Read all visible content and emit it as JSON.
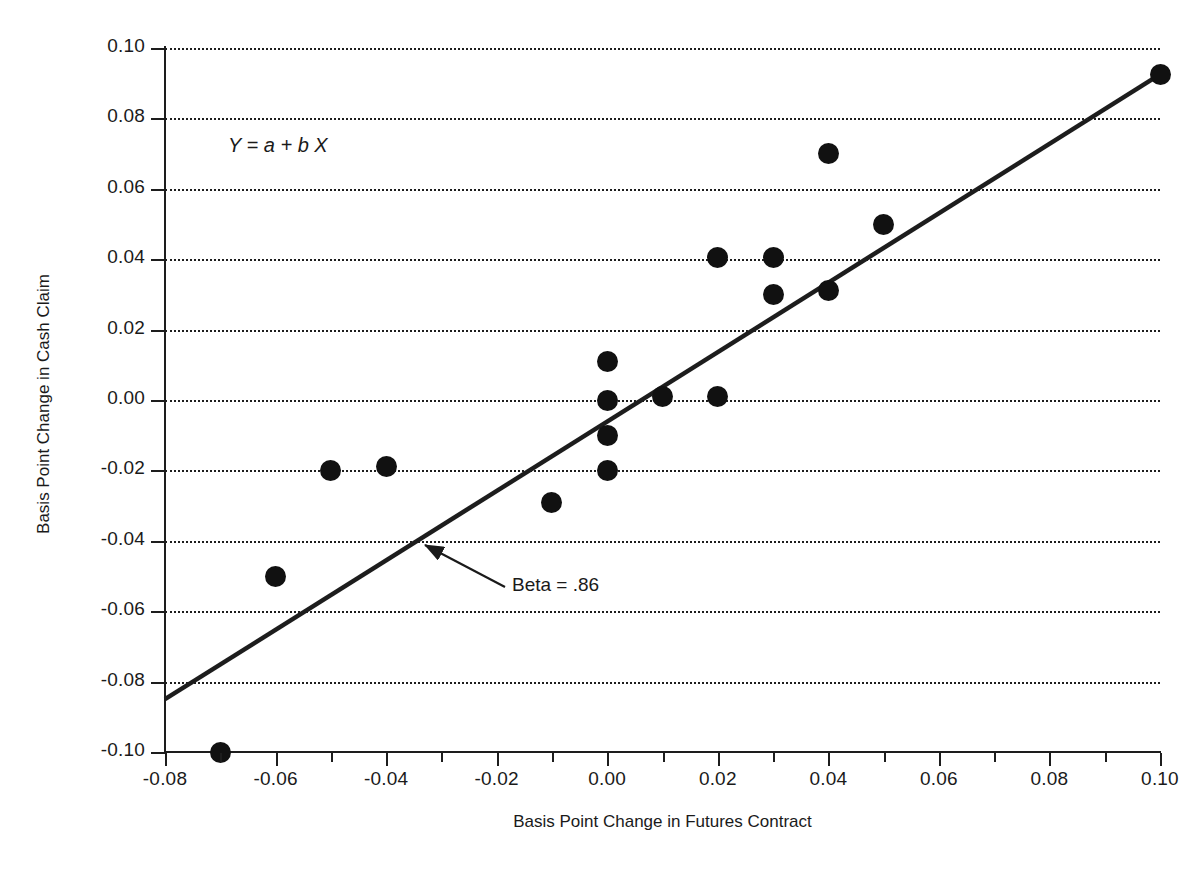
{
  "chart_data": {
    "type": "scatter",
    "title": "",
    "xlabel": "Basis Point Change in Futures Contract",
    "ylabel": "Basis Point Change in Cash Claim",
    "xlim": [
      -0.08,
      0.1
    ],
    "ylim": [
      -0.1,
      0.1
    ],
    "grid": "horizontal-dotted",
    "legend": "none",
    "xticks": [
      -0.08,
      -0.06,
      -0.04,
      -0.02,
      0.0,
      0.02,
      0.04,
      0.06,
      0.08,
      0.1
    ],
    "xtick_labels": [
      "-0.08",
      "-0.06",
      "-0.04",
      "-0.02",
      "0.00",
      "0.02",
      "0.04",
      "0.06",
      "0.08",
      "0.10"
    ],
    "x_minor_ticks": [
      -0.07,
      -0.05,
      -0.03,
      -0.01,
      0.01,
      0.03,
      0.05,
      0.07,
      0.09
    ],
    "yticks": [
      0.1,
      0.08,
      0.06,
      0.04,
      0.02,
      0.0,
      -0.02,
      -0.04,
      -0.06,
      -0.08,
      -0.1
    ],
    "ytick_labels": [
      "0.10",
      "0.08",
      "0.06",
      "0.04",
      "0.02",
      "0.00",
      "-0.02",
      "-0.04",
      "-0.06",
      "-0.08",
      "-0.10"
    ],
    "points": [
      {
        "x": -0.07,
        "y": -0.1
      },
      {
        "x": -0.06,
        "y": -0.05
      },
      {
        "x": -0.05,
        "y": -0.02
      },
      {
        "x": -0.04,
        "y": -0.019
      },
      {
        "x": -0.01,
        "y": -0.029
      },
      {
        "x": 0.0,
        "y": 0.011
      },
      {
        "x": 0.0,
        "y": 0.0
      },
      {
        "x": 0.0,
        "y": -0.01
      },
      {
        "x": 0.0,
        "y": -0.02
      },
      {
        "x": 0.01,
        "y": 0.001
      },
      {
        "x": 0.02,
        "y": 0.0405
      },
      {
        "x": 0.02,
        "y": 0.001
      },
      {
        "x": 0.03,
        "y": 0.0405
      },
      {
        "x": 0.03,
        "y": 0.03
      },
      {
        "x": 0.04,
        "y": 0.07
      },
      {
        "x": 0.04,
        "y": 0.031
      },
      {
        "x": 0.05,
        "y": 0.05
      },
      {
        "x": 0.1,
        "y": 0.0925
      }
    ],
    "fit_line": {
      "slope": 0.86,
      "x_start": -0.08,
      "y_start": -0.085,
      "x_end": 0.1,
      "y_end": 0.0925
    },
    "annotations": [
      {
        "name": "equation",
        "text": "Y = a + b X"
      },
      {
        "name": "beta",
        "text": "Beta = .86"
      }
    ],
    "colors": {
      "marker": "#111111",
      "line": "#1d1d1d",
      "grid": "#1d1d1d",
      "text": "#1a1a1a",
      "background": "#ffffff"
    }
  }
}
